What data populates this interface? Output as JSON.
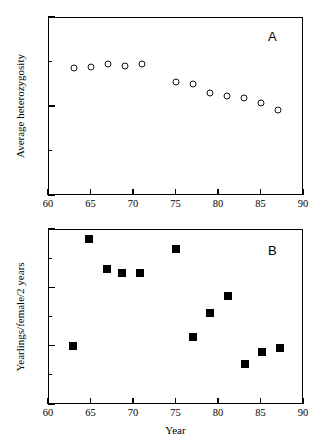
{
  "figure": {
    "background_color": "#ffffff",
    "marker_color": "#000000",
    "panels": [
      "A",
      "B"
    ]
  },
  "panel_a": {
    "letter": "A",
    "ylabel": "Average heterozygosity",
    "xlabel": "",
    "y_ticks": [
      "0.15",
      "0.2",
      "0.25"
    ],
    "x_ticks": [
      "60",
      "65",
      "70",
      "75",
      "80",
      "85",
      "90"
    ]
  },
  "panel_b": {
    "letter": "B",
    "ylabel": "Yearlings/female/2 years",
    "xlabel": "Year",
    "y_ticks": [
      "0",
      "1",
      "2",
      "3"
    ],
    "x_ticks": [
      "60",
      "65",
      "70",
      "75",
      "80",
      "85",
      "90"
    ]
  },
  "chart_data": [
    {
      "type": "scatter",
      "panel": "A",
      "title": "",
      "xlabel": "",
      "ylabel": "Average heterozygosity",
      "xlim": [
        60,
        90
      ],
      "ylim": [
        0.15,
        0.25
      ],
      "xticks": [
        60,
        65,
        70,
        75,
        80,
        85,
        90
      ],
      "yticks": [
        0.15,
        0.2,
        0.25
      ],
      "yminorticks": [
        0.175,
        0.225
      ],
      "grid": false,
      "legend": null,
      "marker": "open-circle",
      "series": [
        {
          "name": "Average heterozygosity",
          "x": [
            63,
            65,
            67,
            69,
            71,
            75,
            77,
            79,
            81,
            83,
            85,
            87
          ],
          "y": [
            0.2215,
            0.2218,
            0.2235,
            0.2225,
            0.2235,
            0.2135,
            0.2125,
            0.2075,
            0.2055,
            0.2045,
            0.2015,
            0.1975
          ]
        }
      ]
    },
    {
      "type": "scatter",
      "panel": "B",
      "title": "",
      "xlabel": "Year",
      "ylabel": "Yearlings/female/2 years",
      "xlim": [
        60,
        90
      ],
      "ylim": [
        0,
        3
      ],
      "xticks": [
        60,
        65,
        70,
        75,
        80,
        85,
        90
      ],
      "yticks": [
        0,
        1,
        2,
        3
      ],
      "yminorticks": [
        0.5,
        1.5,
        2.5
      ],
      "grid": false,
      "legend": null,
      "marker": "filled-square",
      "series": [
        {
          "name": "Yearlings/female/2 years",
          "x": [
            62.9,
            64.8,
            66.9,
            68.7,
            70.8,
            75.0,
            77.1,
            79.1,
            81.2,
            83.2,
            85.2,
            87.3
          ],
          "y": [
            1.0,
            2.83,
            2.31,
            2.24,
            2.24,
            2.66,
            1.15,
            1.56,
            1.86,
            0.69,
            0.89,
            0.96
          ]
        }
      ]
    }
  ]
}
